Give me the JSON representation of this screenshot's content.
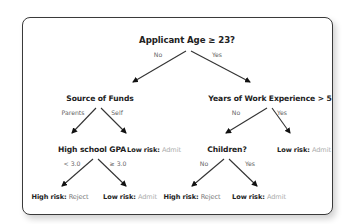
{
  "root": {
    "question": "Applicant Age ≥ 23?",
    "no_label": "No",
    "yes_label": "Yes"
  },
  "source_of_funds": {
    "question": "Source of Funds",
    "left_label": "Parents",
    "right_label": "Self"
  },
  "work_experience": {
    "question": "Years of Work Experience > 5",
    "no_label": "No",
    "yes_label": "Yes"
  },
  "gpa": {
    "question": "High school GPA",
    "left_label": "< 3.0",
    "right_label": "≥ 3.0"
  },
  "children": {
    "question": "Children?",
    "no_label": "No",
    "yes_label": "Yes"
  },
  "leaves": {
    "self": {
      "risk": "Low risk:",
      "decision": "Admit"
    },
    "exp_yes": {
      "risk": "Low risk:",
      "decision": "Admit"
    },
    "gpa_low": {
      "risk": "High risk:",
      "decision": "Reject"
    },
    "gpa_high": {
      "risk": "Low risk:",
      "decision": "Admit"
    },
    "children_no": {
      "risk": "High risk:",
      "decision": "Reject"
    },
    "children_yes": {
      "risk": "Low risk:",
      "decision": "Admit"
    }
  },
  "colors": {
    "text": "#222222",
    "reject": "#777777",
    "admit": "#aaaaaa",
    "edge": "#333333"
  }
}
